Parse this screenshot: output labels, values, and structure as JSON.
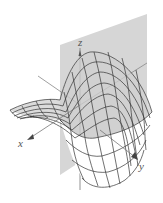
{
  "figure": {
    "title": "",
    "axes": {
      "x_label": "x",
      "y_label": "y",
      "z_label": "z"
    },
    "colors": {
      "plane": "#d4d4d4",
      "surface_shade": "#c8c8c8",
      "mesh": "#333333",
      "axis": "#777777"
    }
  }
}
